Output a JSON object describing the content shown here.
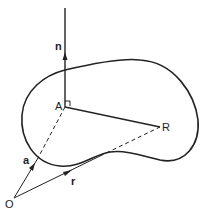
{
  "diagram": {
    "labels": {
      "n": "n",
      "A": "A",
      "R": "R",
      "a": "a",
      "r": "r",
      "O": "O"
    },
    "colors": {
      "stroke": "#222222",
      "background": "#ffffff"
    }
  }
}
